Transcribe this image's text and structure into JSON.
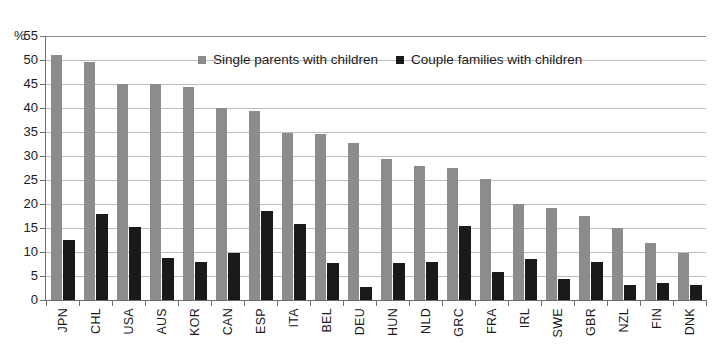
{
  "chart_data": {
    "type": "bar",
    "title": "",
    "xlabel": "",
    "ylabel": "%",
    "ylim": [
      0,
      55
    ],
    "yticks": [
      0,
      5,
      10,
      15,
      20,
      25,
      30,
      35,
      40,
      45,
      50,
      55
    ],
    "grid": true,
    "legend_position": "top-center",
    "categories": [
      "JPN",
      "CHL",
      "USA",
      "AUS",
      "KOR",
      "CAN",
      "ESP",
      "ITA",
      "BEL",
      "DEU",
      "HUN",
      "NLD",
      "GRC",
      "FRA",
      "IRL",
      "SWE",
      "GBR",
      "NZL",
      "FIN",
      "DNK"
    ],
    "series": [
      {
        "name": "Single parents with children",
        "color": "#8c8c8c",
        "values": [
          51.0,
          49.5,
          45.0,
          45.0,
          44.3,
          40.0,
          39.3,
          34.8,
          34.5,
          32.7,
          29.3,
          28.0,
          27.5,
          25.3,
          20.0,
          19.2,
          17.5,
          15.0,
          11.8,
          9.8
        ]
      },
      {
        "name": "Couple families with children",
        "color": "#1a1a1a",
        "values": [
          12.5,
          18.0,
          15.3,
          8.7,
          8.0,
          9.7,
          18.5,
          15.8,
          7.8,
          2.7,
          7.8,
          8.0,
          15.5,
          5.8,
          8.5,
          4.3,
          8.0,
          3.2,
          3.5,
          3.2
        ]
      }
    ]
  },
  "axis": {
    "unit_label": "%"
  },
  "legend": {
    "items": [
      {
        "label": "Single parents with children",
        "swatch": "single"
      },
      {
        "label": "Couple families with children",
        "swatch": "couple"
      }
    ]
  }
}
